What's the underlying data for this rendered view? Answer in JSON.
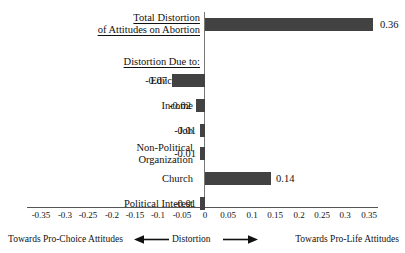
{
  "chart_data": {
    "type": "bar",
    "orientation": "horizontal",
    "title": "",
    "xlabel": "Distortion",
    "ylabel": "",
    "xlim": [
      -0.375,
      0.375
    ],
    "grid": false,
    "legend": null,
    "categories": [
      "Total Distortion of Attitudes on Abortion",
      "Education",
      "Income",
      "Job",
      "Non-Political Organization",
      "Church",
      "Political Interest"
    ],
    "values": [
      0.36,
      -0.07,
      -0.02,
      -0.01,
      -0.01,
      0.14,
      -0.01
    ],
    "value_labels": [
      "0.36",
      "-0.07",
      "-0.02",
      "-0.01",
      "-0.01",
      "0.14",
      "-0.01"
    ],
    "xticks": [
      -0.35,
      -0.3,
      -0.25,
      -0.2,
      -0.15,
      -0.1,
      -0.05,
      0,
      0.05,
      0.1,
      0.15,
      0.2,
      0.25,
      0.3,
      0.35
    ],
    "xtick_labels": [
      "-0.35",
      "-0.3",
      "-0.25",
      "-0.2",
      "-0.15",
      "-0.1",
      "-0.05",
      "0",
      "0.05",
      "0.1",
      "0.15",
      "0.2",
      "0.25",
      "0.3",
      "0.35"
    ],
    "bar_color": "#424242",
    "axis_color": "#555555"
  },
  "headings": {
    "total_line1": "Total Distortion",
    "total_line2": "of Attitudes on Abortion",
    "due_to": "Distortion Due to:"
  },
  "rows": [
    {
      "label": "Education",
      "value_label": "-0.07"
    },
    {
      "label": "Income",
      "value_label": "-0.02"
    },
    {
      "label": "Job",
      "value_label": "-0.01"
    },
    {
      "label": "Non-Political",
      "label2": "Organization",
      "value_label": "-0.01"
    },
    {
      "label": "Church",
      "value_label": "0.14"
    },
    {
      "label": "Political Interest",
      "value_label": "-0.01"
    }
  ],
  "total": {
    "value_label": "0.36"
  },
  "axis": {
    "labels": [
      "-0.35",
      "-0.3",
      "-0.25",
      "-0.2",
      "-0.15",
      "-0.1",
      "-0.05",
      "0",
      "0.05",
      "0.1",
      "0.15",
      "0.2",
      "0.25",
      "0.3",
      "0.35"
    ]
  },
  "footer": {
    "left": "Towards Pro-Choice Attitudes",
    "middle": "Distortion",
    "right": "Towards Pro-Life Attitudes"
  }
}
